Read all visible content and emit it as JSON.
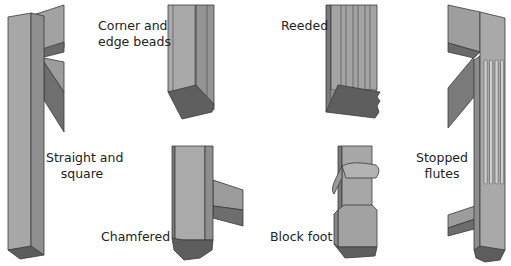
{
  "colors": {
    "face_light": "#a8a8a8",
    "face_mid": "#959595",
    "face_dark": "#6e6e6e",
    "bottom": "#5e5e5e",
    "outline": "#3a3a3a",
    "text": "#222222"
  },
  "legs": [
    {
      "id": "straight-square",
      "label_line1": "Straight and",
      "label_line2": "square"
    },
    {
      "id": "corner-edge-beads",
      "label_line1": "Corner and",
      "label_line2": "edge beads"
    },
    {
      "id": "chamfered",
      "label_line1": "Chamfered"
    },
    {
      "id": "reeded",
      "label_line1": "Reeded"
    },
    {
      "id": "block-foot",
      "label_line1": "Block foot"
    },
    {
      "id": "stopped-flutes",
      "label_line1": "Stopped",
      "label_line2": "flutes"
    }
  ]
}
